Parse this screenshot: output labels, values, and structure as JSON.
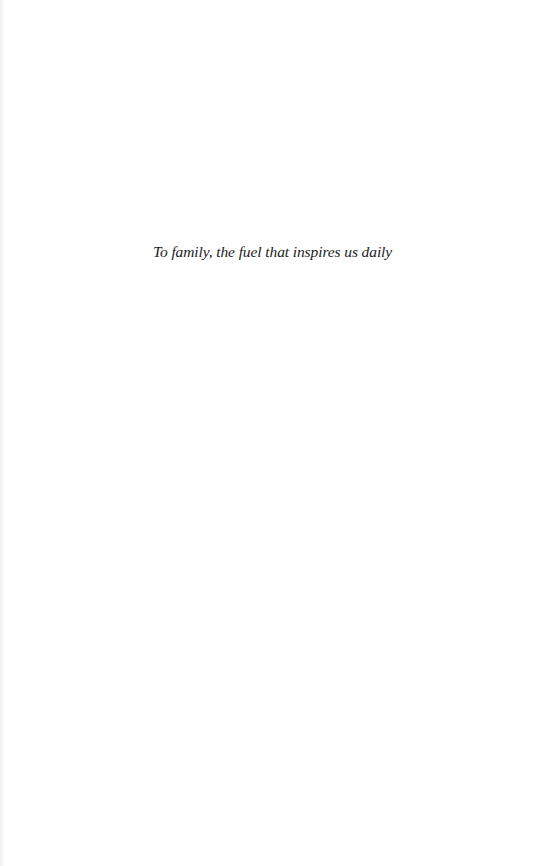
{
  "document": {
    "type": "dedication-page",
    "dedication": "To family, the fuel that inspires us daily"
  },
  "colors": {
    "background": "#ffffff",
    "text": "#1c1c1c",
    "binding_edge": "#f1f1f1"
  }
}
